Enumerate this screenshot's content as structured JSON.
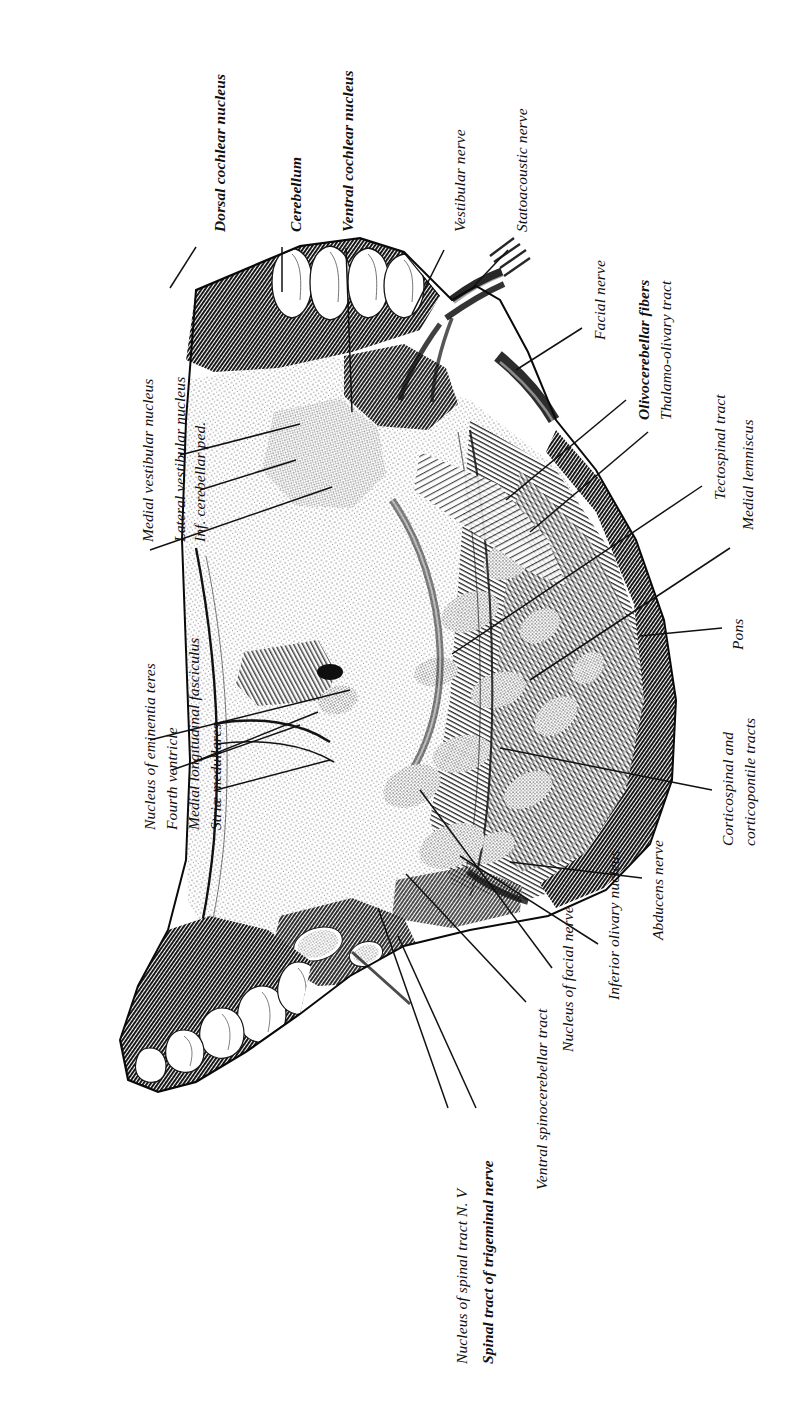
{
  "figure": {
    "orientation": "rotated-90",
    "ink_color": "#111111",
    "background_color": "#ffffff"
  },
  "labels": [
    {
      "id": "dorsal-cochlear-nucleus",
      "text": "Dorsal cochlear nucleus",
      "bold": true,
      "x": 212,
      "y": 232,
      "leader": [
        196,
        247,
        170,
        288
      ]
    },
    {
      "id": "cerebellum",
      "text": "Cerebellum",
      "bold": true,
      "x": 288,
      "y": 232,
      "leader": [
        282,
        247,
        282,
        292
      ]
    },
    {
      "id": "ventral-cochlear-nucleus",
      "text": "Ventral cochlear nucleus",
      "bold": true,
      "x": 340,
      "y": 232,
      "leader": [
        346,
        248,
        352,
        412
      ]
    },
    {
      "id": "vestibular-nerve",
      "text": "Vestibular nerve",
      "bold": false,
      "x": 452,
      "y": 232,
      "leader": [
        444,
        250,
        412,
        314
      ]
    },
    {
      "id": "statoacoustic-nerve",
      "text": "Statoacoustic nerve",
      "bold": false,
      "x": 514,
      "y": 232,
      "leader": [
        508,
        250,
        474,
        286
      ]
    },
    {
      "id": "medial-vestibular-nucleus",
      "text": "Medial vestibular nucleus",
      "bold": false,
      "x": 140,
      "y": 542,
      "leader": [
        150,
        550,
        332,
        487
      ]
    },
    {
      "id": "lateral-vestibular-nucleus",
      "text": "Lateral vestibular nucleus",
      "bold": false,
      "x": 172,
      "y": 542,
      "leader": [
        180,
        455,
        300,
        424
      ]
    },
    {
      "id": "inf-cerebellar-ped",
      "text": "Inf. cerebellar ped.",
      "bold": false,
      "x": 192,
      "y": 542,
      "leader": [
        200,
        490,
        296,
        460
      ]
    },
    {
      "id": "nucleus-of-eminentia-teres",
      "text": "Nucleus of eminentia teres",
      "bold": false,
      "x": 142,
      "y": 830,
      "leader": [
        150,
        740,
        350,
        690
      ]
    },
    {
      "id": "fourth-ventricle",
      "text": "Fourth ventricle",
      "bold": false,
      "x": 164,
      "y": 830,
      "leader": [
        172,
        770,
        300,
        725
      ]
    },
    {
      "id": "medial-longitudinal-fasciculus",
      "text": "Medial longitudinal fasciculus",
      "bold": false,
      "x": 186,
      "y": 830,
      "leader": [
        194,
        762,
        318,
        712
      ]
    },
    {
      "id": "striae-medullares",
      "text": "Striæ medullares",
      "bold": false,
      "x": 208,
      "y": 830,
      "leader": [
        216,
        790,
        330,
        760
      ]
    },
    {
      "id": "facial-nerve",
      "text": "Facial nerve",
      "bold": false,
      "x": 592,
      "y": 340,
      "leader": [
        582,
        328,
        516,
        370
      ]
    },
    {
      "id": "olivocerebellar-fibers",
      "text": "Olivocerebellar fibers",
      "bold": true,
      "x": 636,
      "y": 420,
      "leader": [
        626,
        400,
        506,
        500
      ]
    },
    {
      "id": "thalamo-olivary-tract",
      "text": "Thalamo-olivary tract",
      "bold": false,
      "x": 658,
      "y": 420,
      "leader": [
        648,
        432,
        530,
        532
      ]
    },
    {
      "id": "tectospinal-tract",
      "text": "Tectospinal tract",
      "bold": false,
      "x": 712,
      "y": 500,
      "leader": [
        702,
        486,
        452,
        654
      ]
    },
    {
      "id": "medial-lemniscus",
      "text": "Medial lemniscus",
      "bold": false,
      "x": 740,
      "y": 530,
      "leader": [
        730,
        548,
        530,
        680
      ]
    },
    {
      "id": "pons",
      "text": "Pons",
      "bold": false,
      "x": 730,
      "y": 650,
      "leader": [
        722,
        628,
        640,
        636
      ]
    },
    {
      "id": "corticospinal-corticopontile-1",
      "text": "Corticospinal and",
      "bold": false,
      "x": 720,
      "y": 846,
      "leader": [
        712,
        790,
        500,
        748
      ]
    },
    {
      "id": "corticospinal-corticopontile-2",
      "text": "corticopontile tracts",
      "bold": false,
      "x": 742,
      "y": 846,
      "leader": null
    },
    {
      "id": "abducens-nerve",
      "text": "Abducens nerve",
      "bold": false,
      "x": 650,
      "y": 940,
      "leader": [
        642,
        878,
        510,
        862
      ]
    },
    {
      "id": "inferior-olivary-nucleus",
      "text": "Inferior olivary nucleus",
      "bold": false,
      "x": 606,
      "y": 1000,
      "leader": [
        598,
        944,
        460,
        856
      ]
    },
    {
      "id": "nucleus-of-facial-nerve",
      "text": "Nucleus of facial nerve",
      "bold": false,
      "x": 560,
      "y": 1052,
      "leader": [
        552,
        968,
        420,
        790
      ]
    },
    {
      "id": "ventral-spinocerebellar-tract",
      "text": "Ventral spinocerebellar tract",
      "bold": false,
      "x": 534,
      "y": 1190,
      "leader": [
        526,
        1002,
        406,
        874
      ]
    },
    {
      "id": "nucleus-of-spinal-tract-n5",
      "text": "Nucleus of spinal tract N. V",
      "bold": false,
      "x": 454,
      "y": 1364,
      "leader": [
        448,
        1108,
        378,
        908
      ]
    },
    {
      "id": "spinal-tract-of-trigeminal-nerve",
      "text": "Spinal tract of trigeminal nerve",
      "bold": true,
      "x": 480,
      "y": 1364,
      "leader": [
        476,
        1108,
        398,
        936
      ]
    }
  ]
}
